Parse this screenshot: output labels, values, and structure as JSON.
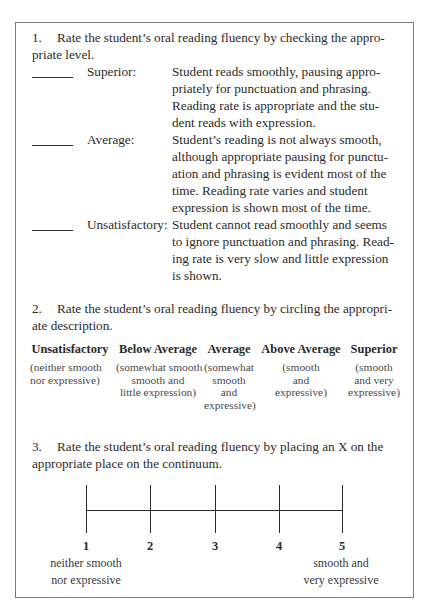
{
  "section1": {
    "number": "1.",
    "prompt_line1": "Rate the student’s oral reading fluency by checking the appro-",
    "prompt_line2": "priate level.",
    "ratings": [
      {
        "label": "Superior:",
        "description_lines": [
          "Student reads smoothly, pausing appro-",
          "priately for punctuation and phrasing.",
          "Reading rate is appropriate and the stu-",
          "dent reads with expression."
        ]
      },
      {
        "label": "Average:",
        "description_lines": [
          "Student’s reading is not always smooth,",
          "although appropriate pausing for punctu-",
          "ation and phrasing is evident most of the",
          "time. Reading rate varies and student",
          "expression is shown most of the time."
        ]
      },
      {
        "label": "Unsatisfactory:",
        "description_lines": [
          "Student cannot read smoothly and seems",
          "to ignore punctuation and phrasing. Read-",
          "ing rate is very slow and little expression",
          "is shown."
        ]
      }
    ]
  },
  "section2": {
    "number": "2.",
    "prompt_line1": "Rate the student’s oral reading fluency by circling the appropri-",
    "prompt_line2": "ate description.",
    "options": [
      {
        "heading": "Unsatisfactory",
        "sub_lines": [
          "(neither smooth",
          "nor expressive)"
        ]
      },
      {
        "heading": "Below Average",
        "sub_lines": [
          "(somewhat smooth",
          "smooth and",
          "little expression)"
        ]
      },
      {
        "heading": "Average",
        "sub_lines": [
          "(somewhat",
          "smooth",
          "and",
          "expressive)"
        ]
      },
      {
        "heading": "Above Average",
        "sub_lines": [
          "(smooth",
          "and",
          "expressive)"
        ]
      },
      {
        "heading": "Superior",
        "sub_lines": [
          "(smooth",
          "and very",
          "expressive)"
        ]
      }
    ]
  },
  "section3": {
    "number": "3.",
    "prompt_line1": "Rate the student’s oral reading fluency by placing an X on the",
    "prompt_line2": "appropriate place on the continuum.",
    "ticks": [
      "1",
      "2",
      "3",
      "4",
      "5"
    ],
    "left_label_lines": [
      "neither smooth",
      "nor expressive"
    ],
    "right_label_lines": [
      "smooth and",
      "very expressive"
    ]
  }
}
